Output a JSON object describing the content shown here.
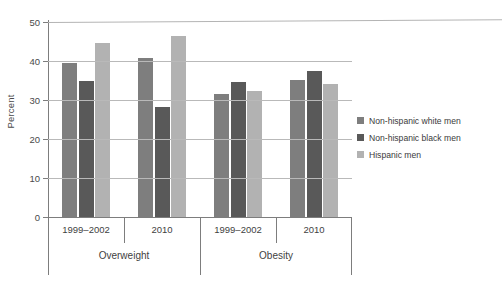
{
  "chart_data": {
    "type": "bar",
    "title": "",
    "xlabel": "",
    "ylabel": "Percent",
    "ylim": [
      0,
      50
    ],
    "yticks": [
      0,
      10,
      20,
      30,
      40,
      50
    ],
    "grid": true,
    "legend_position": "right",
    "categories": [
      "1999–2002",
      "2010",
      "1999–2002",
      "2010"
    ],
    "group_labels": [
      "Overweight",
      "Obesity"
    ],
    "groups": [
      {
        "label": "Overweight",
        "periods": [
          {
            "category": "1999–2002",
            "values": [
              39.5,
              35.0,
              44.5
            ]
          },
          {
            "category": "2010",
            "values": [
              40.7,
              28.2,
              46.5
            ]
          }
        ]
      },
      {
        "label": "Obesity",
        "periods": [
          {
            "category": "1999–2002",
            "values": [
              31.5,
              34.5,
              32.3
            ]
          },
          {
            "category": "2010",
            "values": [
              35.2,
              37.5,
              34.0
            ]
          }
        ]
      }
    ],
    "series": [
      {
        "name": "Non-hispanic white men",
        "color": "#7e7e7e",
        "values": [
          39.5,
          40.7,
          31.5,
          35.2
        ]
      },
      {
        "name": "Non-hispanic black men",
        "color": "#595959",
        "values": [
          35.0,
          28.2,
          34.5,
          37.5
        ]
      },
      {
        "name": "Hispanic men",
        "color": "#b2b2b2",
        "values": [
          44.5,
          46.5,
          32.3,
          34.0
        ]
      }
    ]
  },
  "legend": {
    "items": [
      {
        "label": "Non-hispanic white men",
        "color": "#7e7e7e"
      },
      {
        "label": "Non-hispanic black men",
        "color": "#595959"
      },
      {
        "label": "Hispanic men",
        "color": "#b2b2b2"
      }
    ]
  },
  "axis": {
    "y_label": "Percent",
    "y_ticks": [
      "0",
      "10",
      "20",
      "30",
      "40",
      "50"
    ]
  }
}
